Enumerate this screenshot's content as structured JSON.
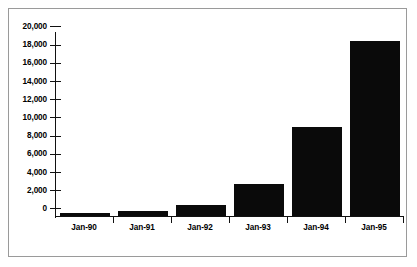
{
  "chart_data": {
    "type": "bar",
    "title": "",
    "xlabel": "",
    "ylabel": "",
    "categories": [
      "Jan-90",
      "Jan-91",
      "Jan-92",
      "Jan-93",
      "Jan-94",
      "Jan-95"
    ],
    "values": [
      300,
      600,
      1200,
      3500,
      9800,
      19200
    ],
    "ylim": [
      0,
      20000
    ],
    "ytick_step": 2000,
    "ytick_labels": [
      "20,000",
      "18,000",
      "16,000",
      "14,000",
      "12,000",
      "10,000",
      "8,000",
      "6,000",
      "4,000",
      "2,000",
      "0"
    ],
    "ytick_values": [
      20000,
      18000,
      16000,
      14000,
      12000,
      10000,
      8000,
      6000,
      4000,
      2000,
      0
    ],
    "grid": false,
    "legend": false,
    "legend_position": "none",
    "series": [
      {
        "name": "",
        "values": [
          300,
          600,
          1200,
          3500,
          9800,
          19200
        ]
      }
    ],
    "colors": {
      "bar": "#0a0a0a",
      "axis": "#111111",
      "frame": "#9a9a9a",
      "background": "#ffffff",
      "text": "#000000"
    }
  }
}
